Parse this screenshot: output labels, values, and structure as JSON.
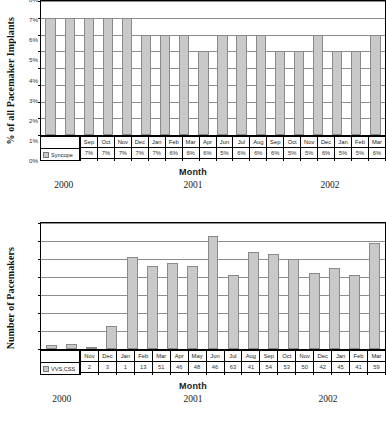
{
  "chart_data": [
    {
      "type": "bar",
      "id": "syncope-percent",
      "title": "",
      "xlabel": "Month",
      "ylabel": "% of all Pacemaker Implants",
      "ylim": [
        0,
        8
      ],
      "ytick_labels": [
        "0%",
        "1%",
        "2%",
        "3%",
        "4%",
        "5%",
        "6%",
        "7%",
        "8%"
      ],
      "ytick_values": [
        0,
        1,
        2,
        3,
        4,
        5,
        6,
        7,
        8
      ],
      "grid": true,
      "legend_position": "table-row",
      "categories": [
        "Sep",
        "Oct",
        "Nov",
        "Dec",
        "Jan",
        "Feb",
        "Mar",
        "Apr",
        "Jun",
        "Jul",
        "Aug",
        "Sep",
        "Oct",
        "Nov",
        "Dec",
        "Jan",
        "Feb",
        "Mar"
      ],
      "series": [
        {
          "name": "Syncope",
          "values": [
            7,
            7,
            7,
            7,
            7,
            6,
            6,
            6,
            5,
            6,
            6,
            6,
            5,
            5,
            6,
            5,
            5,
            6
          ],
          "value_labels": [
            "7%",
            "7%",
            "7%",
            "7%",
            "7%",
            "6%",
            "6%",
            "6%",
            "5%",
            "6%",
            "6%",
            "6%",
            "5%",
            "5%",
            "6%",
            "5%",
            "5%",
            "6%"
          ],
          "color": "#c9c9c9"
        }
      ],
      "year_groups": [
        {
          "label": "2000",
          "center_pct": 16.5
        },
        {
          "label": "2001",
          "center_pct": 50.0
        },
        {
          "label": "2002",
          "center_pct": 85.5
        }
      ]
    },
    {
      "type": "bar",
      "id": "pacemaker-count",
      "title": "",
      "xlabel": "Month",
      "ylabel": "Number of Pacemakers",
      "ylim": [
        0,
        70
      ],
      "ytick_labels": [
        "",
        "",
        "",
        "",
        "",
        "",
        "",
        ""
      ],
      "ytick_values": [
        0,
        10,
        20,
        30,
        40,
        50,
        60,
        70
      ],
      "grid": true,
      "legend_position": "table-row",
      "categories": [
        "Nov",
        "Dec",
        "Jan",
        "Feb",
        "Mar",
        "Apr",
        "May",
        "Jun",
        "Jul",
        "Aug",
        "Sep",
        "Oct",
        "Nov",
        "Dec",
        "Jan",
        "Feb",
        "Mar"
      ],
      "series": [
        {
          "name": "VVS,CSS",
          "values": [
            2,
            3,
            1,
            13,
            51,
            46,
            48,
            46,
            63,
            41,
            54,
            53,
            50,
            42,
            45,
            41,
            59
          ],
          "value_labels": [
            "2",
            "3",
            "1",
            "13",
            "51",
            "46",
            "48",
            "46",
            "63",
            "41",
            "54",
            "53",
            "50",
            "42",
            "45",
            "41",
            "59"
          ],
          "color": "#c9c9c9"
        }
      ],
      "year_groups": [
        {
          "label": "2000",
          "center_pct": 16.0
        },
        {
          "label": "2001",
          "center_pct": 50.0
        },
        {
          "label": "2002",
          "center_pct": 85.0
        }
      ]
    }
  ],
  "colors": {
    "bar_fill": "#c9c9c9",
    "bar_stroke": "#8a8a8a",
    "gridline": "#8d8d8d",
    "axis": "#000000",
    "text": "#222222",
    "background": "#ffffff"
  }
}
